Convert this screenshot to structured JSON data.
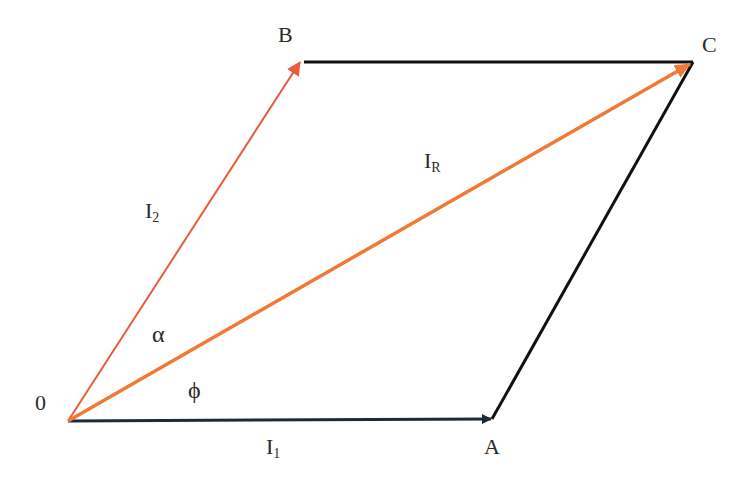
{
  "diagram": {
    "type": "phasor-parallelogram",
    "points": {
      "origin": {
        "label": "0",
        "x": 68,
        "y": 421
      },
      "A": {
        "label": "A",
        "x": 492,
        "y": 419
      },
      "B": {
        "label": "B",
        "x": 300,
        "y": 62
      },
      "C": {
        "label": "C",
        "x": 693,
        "y": 62
      }
    },
    "vectors": [
      {
        "id": "I1",
        "label": "I",
        "subscript": "1",
        "from": "origin",
        "to": "A",
        "color": "#1c2a3a"
      },
      {
        "id": "I2",
        "label": "I",
        "subscript": "2",
        "from": "origin",
        "to": "B",
        "color": "#ea5a3c"
      },
      {
        "id": "IR",
        "label": "I",
        "subscript": "R",
        "from": "origin",
        "to": "C",
        "color": "#f07a35"
      }
    ],
    "edges": [
      {
        "id": "BC",
        "from": "B",
        "to": "C",
        "color": "#111111"
      },
      {
        "id": "AC",
        "from": "A",
        "to": "C",
        "color": "#111111"
      }
    ],
    "angles": {
      "alpha": {
        "symbol": "α"
      },
      "phi": {
        "symbol": "ϕ"
      }
    }
  }
}
